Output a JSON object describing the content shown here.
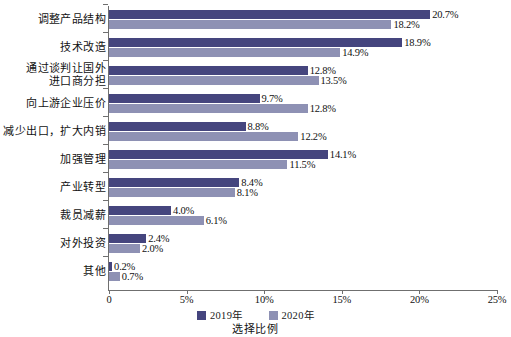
{
  "chart_data": {
    "type": "bar",
    "orientation": "horizontal",
    "title": "",
    "xlabel": "选择比例",
    "ylabel": "",
    "xlim": [
      0,
      25
    ],
    "xunit": "%",
    "grid": false,
    "legend_position": "bottom",
    "tick_labels": [
      "0",
      "5%",
      "10%",
      "15%",
      "20%",
      "25%"
    ],
    "tick_values": [
      0,
      5,
      10,
      15,
      20,
      25
    ],
    "categories": [
      "调整产品结构",
      "技术改造",
      "通过谈判让国外\n进口商分担",
      "向上游企业压价",
      "减少出口，扩大内销",
      "加强管理",
      "产业转型",
      "裁员减薪",
      "对外投资",
      "其他"
    ],
    "series": [
      {
        "name": "2019年",
        "color": "#45457e",
        "values": [
          20.7,
          18.9,
          12.8,
          9.7,
          8.8,
          14.1,
          8.4,
          4.0,
          2.4,
          0.2
        ],
        "labels": [
          "20.7%",
          "18.9%",
          "12.8%",
          "9.7%",
          "8.8%",
          "14.1%",
          "8.4%",
          "4.0%",
          "2.4%",
          "0.2%"
        ]
      },
      {
        "name": "2020年",
        "color": "#8e91b4",
        "values": [
          18.2,
          14.9,
          13.5,
          12.8,
          12.2,
          11.5,
          8.1,
          6.1,
          2.0,
          0.7
        ],
        "labels": [
          "18.2%",
          "14.9%",
          "13.5%",
          "12.8%",
          "12.2%",
          "11.5%",
          "8.1%",
          "6.1%",
          "2.0%",
          "0.7%"
        ]
      }
    ]
  },
  "legend": {
    "items": [
      {
        "label": "2019年",
        "color": "#45457e"
      },
      {
        "label": "2020年",
        "color": "#8e91b4"
      }
    ]
  },
  "axis": {
    "x_title": "选择比例"
  }
}
